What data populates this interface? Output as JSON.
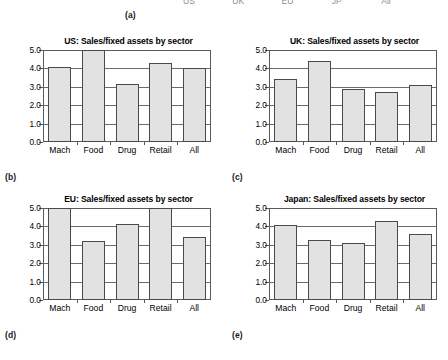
{
  "figure": {
    "panel_a_clipped": {
      "tick_labels": [
        "US",
        "UK",
        "EU",
        "JP",
        "All"
      ],
      "tag": "(a)"
    },
    "axis": {
      "y_ticks": [
        "0.0",
        "1.0",
        "2.0",
        "3.0",
        "4.0",
        "5.0"
      ],
      "y_min": 0.0,
      "y_max": 5.0,
      "categories": [
        "Mach",
        "Food",
        "Drug",
        "Retail",
        "All"
      ]
    },
    "panels": [
      {
        "tag": "(b)",
        "title": "US: Sales/fixed assets by sector"
      },
      {
        "tag": "(c)",
        "title": "UK: Sales/fixed assets by sector"
      },
      {
        "tag": "(d)",
        "title": "EU: Sales/fixed assets by sector"
      },
      {
        "tag": "(e)",
        "title": "Japan: Sales/fixed assets by sector"
      }
    ]
  },
  "chart_data": [
    {
      "type": "bar",
      "panel": "(b)",
      "title": "US: Sales/fixed assets by sector",
      "xlabel": "",
      "ylabel": "",
      "ylim": [
        0.0,
        5.0
      ],
      "yticks": [
        0.0,
        1.0,
        2.0,
        3.0,
        4.0,
        5.0
      ],
      "grid": true,
      "legend": false,
      "categories": [
        "Mach",
        "Food",
        "Drug",
        "Retail",
        "All"
      ],
      "values": [
        4.05,
        5.05,
        3.15,
        4.3,
        4.0
      ],
      "bar_color": "#e2e2e2",
      "bar_edge_color": "#4a4a4a"
    },
    {
      "type": "bar",
      "panel": "(c)",
      "title": "UK: Sales/fixed assets by sector",
      "xlabel": "",
      "ylabel": "",
      "ylim": [
        0.0,
        5.0
      ],
      "yticks": [
        0.0,
        1.0,
        2.0,
        3.0,
        4.0,
        5.0
      ],
      "grid": true,
      "legend": false,
      "categories": [
        "Mach",
        "Food",
        "Drug",
        "Retail",
        "All"
      ],
      "values": [
        3.4,
        4.4,
        2.88,
        2.7,
        3.1
      ],
      "bar_color": "#e2e2e2",
      "bar_edge_color": "#4a4a4a"
    },
    {
      "type": "bar",
      "panel": "(d)",
      "title": "EU: Sales/fixed assets by sector",
      "xlabel": "",
      "ylabel": "",
      "ylim": [
        0.0,
        5.0
      ],
      "yticks": [
        0.0,
        1.0,
        2.0,
        3.0,
        4.0,
        5.0
      ],
      "grid": true,
      "legend": false,
      "categories": [
        "Mach",
        "Food",
        "Drug",
        "Retail",
        "All"
      ],
      "values": [
        5.0,
        3.2,
        4.12,
        5.0,
        3.45
      ],
      "bar_color": "#e2e2e2",
      "bar_edge_color": "#4a4a4a"
    },
    {
      "type": "bar",
      "panel": "(e)",
      "title": "Japan: Sales/fixed assets by sector",
      "xlabel": "",
      "ylabel": "",
      "ylim": [
        0.0,
        5.0
      ],
      "yticks": [
        0.0,
        1.0,
        2.0,
        3.0,
        4.0,
        5.0
      ],
      "grid": true,
      "legend": false,
      "categories": [
        "Mach",
        "Food",
        "Drug",
        "Retail",
        "All"
      ],
      "values": [
        4.05,
        3.28,
        3.1,
        4.3,
        3.6
      ],
      "bar_color": "#e2e2e2",
      "bar_edge_color": "#4a4a4a"
    }
  ]
}
